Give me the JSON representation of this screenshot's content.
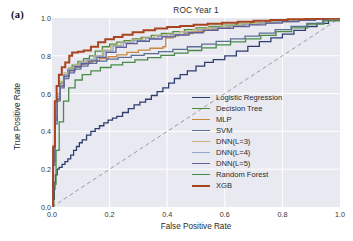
{
  "panel": {
    "label": "(a)"
  },
  "axes": {
    "title": "ROC Year 1",
    "xlabel": "False Positive Rate",
    "ylabel": "True Positive Rate",
    "xticks": [
      "0.0",
      "0.2",
      "0.4",
      "0.6",
      "0.8",
      "1.0"
    ],
    "yticks": [
      "0.0",
      "0.2",
      "0.4",
      "0.6",
      "0.8",
      "1.0"
    ],
    "background_color": "#e9e9f1",
    "gridline_color": "#ffffff",
    "chance_line_color": "#9a9aa8"
  },
  "legend": {
    "position": "lower-right",
    "entries": [
      {
        "label": "Logistic Regression",
        "color": "#2f3d6e",
        "width": 1.3
      },
      {
        "label": "Decision Tree",
        "color": "#4e8a3e",
        "width": 1.3
      },
      {
        "label": "MLP",
        "color": "#c8893f",
        "width": 1.3
      },
      {
        "label": "SVM",
        "color": "#5d6f93",
        "width": 1.3
      },
      {
        "label": "DNN(L=3)",
        "color": "#c3b27a",
        "width": 1.3
      },
      {
        "label": "DNN(L=4)",
        "color": "#8fa6c4",
        "width": 1.3
      },
      {
        "label": "DNN(L=5)",
        "color": "#5f5f96",
        "width": 1.3
      },
      {
        "label": "Random Forest",
        "color": "#4a8a48",
        "width": 1.3
      },
      {
        "label": "XGB",
        "color": "#a8441f",
        "width": 2.0
      }
    ]
  },
  "chart_data": {
    "type": "line",
    "title": "ROC Year 1",
    "xlabel": "False Positive Rate",
    "ylabel": "True Positive Rate",
    "xlim": [
      0.0,
      1.0
    ],
    "ylim": [
      0.0,
      1.0
    ],
    "grid": true,
    "legend_position": "lower right",
    "chance_line": {
      "x": [
        0.0,
        1.0
      ],
      "y": [
        0.0,
        1.0
      ],
      "style": "dashed",
      "color": "#9a9aa8"
    },
    "series": [
      {
        "name": "Logistic Regression",
        "color": "#2f3d6e",
        "x": [
          0.0,
          0.004,
          0.008,
          0.01,
          0.012,
          0.018,
          0.025,
          0.035,
          0.045,
          0.055,
          0.065,
          0.075,
          0.085,
          0.095,
          0.105,
          0.12,
          0.135,
          0.15,
          0.165,
          0.18,
          0.195,
          0.21,
          0.225,
          0.245,
          0.265,
          0.285,
          0.305,
          0.325,
          0.345,
          0.365,
          0.385,
          0.405,
          0.425,
          0.445,
          0.47,
          0.5,
          0.53,
          0.56,
          0.6,
          0.64,
          0.68,
          0.72,
          0.76,
          0.8,
          0.84,
          0.88,
          0.92,
          0.96,
          1.0
        ],
        "y": [
          0.0,
          0.04,
          0.095,
          0.13,
          0.17,
          0.2,
          0.21,
          0.225,
          0.24,
          0.255,
          0.275,
          0.3,
          0.32,
          0.34,
          0.355,
          0.38,
          0.4,
          0.415,
          0.43,
          0.445,
          0.46,
          0.47,
          0.48,
          0.5,
          0.52,
          0.54,
          0.555,
          0.57,
          0.59,
          0.61,
          0.63,
          0.655,
          0.68,
          0.7,
          0.72,
          0.745,
          0.765,
          0.78,
          0.8,
          0.825,
          0.85,
          0.875,
          0.895,
          0.915,
          0.935,
          0.955,
          0.972,
          0.988,
          1.0
        ]
      },
      {
        "name": "Decision Tree",
        "color": "#4e8a3e",
        "x": [
          0.0,
          0.004,
          0.01,
          0.018,
          0.028,
          0.04,
          0.055,
          0.07,
          0.09,
          0.11,
          0.13,
          0.15,
          0.175,
          0.2,
          0.225,
          0.25,
          0.28,
          0.31,
          0.345,
          0.38,
          0.42,
          0.46,
          0.5,
          0.545,
          0.59,
          0.64,
          0.69,
          0.74,
          0.79,
          0.845,
          0.9,
          0.95,
          1.0
        ],
        "y": [
          0.0,
          0.3,
          0.52,
          0.6,
          0.655,
          0.7,
          0.73,
          0.75,
          0.77,
          0.785,
          0.8,
          0.825,
          0.848,
          0.862,
          0.872,
          0.88,
          0.89,
          0.898,
          0.908,
          0.918,
          0.928,
          0.938,
          0.948,
          0.955,
          0.962,
          0.968,
          0.975,
          0.98,
          0.985,
          0.99,
          0.994,
          0.997,
          1.0
        ]
      },
      {
        "name": "MLP",
        "color": "#c8893f",
        "x": [
          0.0,
          0.004,
          0.01,
          0.018,
          0.028,
          0.042,
          0.058,
          0.075,
          0.095,
          0.115,
          0.14,
          0.165,
          0.195,
          0.225,
          0.26,
          0.3,
          0.34,
          0.385,
          0.395,
          0.42,
          0.44,
          0.46,
          0.49,
          0.53,
          0.575,
          0.62,
          0.67,
          0.72,
          0.77,
          0.825,
          0.88,
          0.935,
          1.0
        ],
        "y": [
          0.0,
          0.26,
          0.47,
          0.57,
          0.64,
          0.69,
          0.72,
          0.74,
          0.755,
          0.765,
          0.775,
          0.785,
          0.795,
          0.805,
          0.818,
          0.83,
          0.84,
          0.848,
          0.895,
          0.905,
          0.912,
          0.918,
          0.928,
          0.94,
          0.95,
          0.958,
          0.966,
          0.974,
          0.981,
          0.988,
          0.993,
          0.997,
          1.0
        ]
      },
      {
        "name": "SVM",
        "color": "#5d6f93",
        "x": [
          0.0,
          0.004,
          0.01,
          0.018,
          0.028,
          0.042,
          0.058,
          0.078,
          0.1,
          0.125,
          0.155,
          0.19,
          0.23,
          0.275,
          0.32,
          0.37,
          0.42,
          0.47,
          0.52,
          0.57,
          0.62,
          0.67,
          0.72,
          0.775,
          0.83,
          0.885,
          0.94,
          1.0
        ],
        "y": [
          0.0,
          0.22,
          0.44,
          0.56,
          0.63,
          0.68,
          0.71,
          0.73,
          0.745,
          0.76,
          0.772,
          0.782,
          0.792,
          0.802,
          0.812,
          0.822,
          0.834,
          0.848,
          0.862,
          0.876,
          0.89,
          0.904,
          0.92,
          0.938,
          0.956,
          0.972,
          0.987,
          1.0
        ]
      },
      {
        "name": "DNN(L=3)",
        "color": "#c3b27a",
        "x": [
          0.0,
          0.004,
          0.01,
          0.018,
          0.028,
          0.042,
          0.058,
          0.075,
          0.095,
          0.118,
          0.145,
          0.175,
          0.205,
          0.24,
          0.275,
          0.315,
          0.355,
          0.4,
          0.445,
          0.49,
          0.54,
          0.59,
          0.645,
          0.7,
          0.755,
          0.815,
          0.875,
          0.935,
          1.0
        ],
        "y": [
          0.0,
          0.28,
          0.5,
          0.6,
          0.665,
          0.71,
          0.738,
          0.755,
          0.768,
          0.78,
          0.8,
          0.83,
          0.855,
          0.872,
          0.884,
          0.895,
          0.905,
          0.915,
          0.928,
          0.94,
          0.95,
          0.958,
          0.966,
          0.974,
          0.981,
          0.988,
          0.993,
          0.997,
          1.0
        ]
      },
      {
        "name": "DNN(L=4)",
        "color": "#8fa6c4",
        "x": [
          0.0,
          0.004,
          0.01,
          0.018,
          0.028,
          0.042,
          0.058,
          0.076,
          0.098,
          0.122,
          0.15,
          0.18,
          0.212,
          0.248,
          0.285,
          0.325,
          0.368,
          0.412,
          0.458,
          0.505,
          0.555,
          0.608,
          0.662,
          0.718,
          0.775,
          0.835,
          0.895,
          0.95,
          1.0
        ],
        "y": [
          0.0,
          0.255,
          0.48,
          0.585,
          0.65,
          0.7,
          0.73,
          0.748,
          0.762,
          0.778,
          0.798,
          0.825,
          0.85,
          0.868,
          0.88,
          0.892,
          0.902,
          0.912,
          0.924,
          0.936,
          0.947,
          0.956,
          0.965,
          0.973,
          0.981,
          0.988,
          0.993,
          0.997,
          1.0
        ]
      },
      {
        "name": "DNN(L=5)",
        "color": "#5f5f96",
        "x": [
          0.0,
          0.004,
          0.01,
          0.018,
          0.028,
          0.042,
          0.06,
          0.08,
          0.102,
          0.128,
          0.156,
          0.188,
          0.222,
          0.258,
          0.296,
          0.338,
          0.382,
          0.428,
          0.476,
          0.525,
          0.576,
          0.63,
          0.685,
          0.742,
          0.8,
          0.858,
          0.915,
          0.96,
          1.0
        ],
        "y": [
          0.0,
          0.24,
          0.46,
          0.572,
          0.64,
          0.692,
          0.722,
          0.742,
          0.758,
          0.772,
          0.792,
          0.818,
          0.845,
          0.864,
          0.877,
          0.889,
          0.9,
          0.91,
          0.922,
          0.934,
          0.945,
          0.955,
          0.964,
          0.973,
          0.981,
          0.988,
          0.994,
          0.998,
          1.0
        ]
      },
      {
        "name": "Random Forest",
        "color": "#4a8a48",
        "x": [
          0.0,
          0.006,
          0.014,
          0.025,
          0.04,
          0.058,
          0.08,
          0.105,
          0.135,
          0.168,
          0.205,
          0.245,
          0.288,
          0.332,
          0.378,
          0.425,
          0.472,
          0.52,
          0.57,
          0.62,
          0.672,
          0.725,
          0.778,
          0.832,
          0.888,
          0.944,
          1.0
        ],
        "y": [
          0.0,
          0.12,
          0.3,
          0.45,
          0.56,
          0.63,
          0.672,
          0.7,
          0.72,
          0.738,
          0.752,
          0.765,
          0.778,
          0.79,
          0.802,
          0.814,
          0.828,
          0.842,
          0.858,
          0.874,
          0.89,
          0.908,
          0.928,
          0.948,
          0.968,
          0.985,
          1.0
        ]
      },
      {
        "name": "XGB",
        "color": "#a8441f",
        "x": [
          0.0,
          0.004,
          0.01,
          0.016,
          0.024,
          0.034,
          0.046,
          0.06,
          0.07,
          0.09,
          0.11,
          0.135,
          0.16,
          0.185,
          0.215,
          0.245,
          0.28,
          0.318,
          0.358,
          0.4,
          0.445,
          0.492,
          0.54,
          0.59,
          0.645,
          0.7,
          0.758,
          0.818,
          0.88,
          0.94,
          1.0
        ],
        "y": [
          0.0,
          0.32,
          0.56,
          0.64,
          0.7,
          0.74,
          0.765,
          0.8,
          0.818,
          0.822,
          0.828,
          0.848,
          0.872,
          0.888,
          0.9,
          0.912,
          0.925,
          0.935,
          0.944,
          0.952,
          0.958,
          0.964,
          0.97,
          0.975,
          0.98,
          0.985,
          0.989,
          0.993,
          0.996,
          0.998,
          1.0
        ]
      }
    ]
  }
}
